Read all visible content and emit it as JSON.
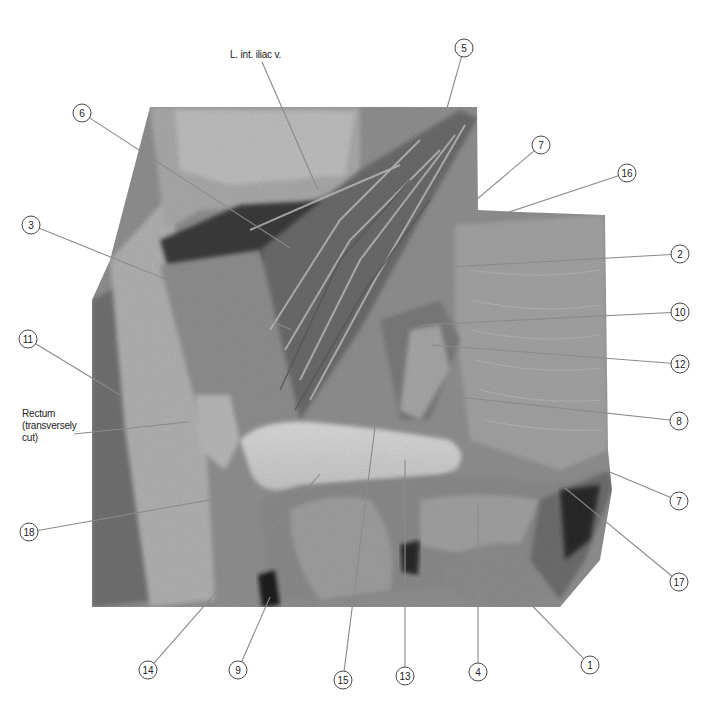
{
  "figure": {
    "type": "anatomical dissection photograph (grayscale)",
    "background": "#ffffff",
    "leader_color": "#8a8a8a"
  },
  "text_labels": [
    {
      "id": "l-int-iliac-v",
      "text": "L. int. iliac v.",
      "x": 230,
      "y": 55,
      "target": [
        318,
        190
      ]
    },
    {
      "id": "rectum",
      "lines": [
        "Rectum",
        "(transversely",
        "cut)"
      ],
      "x": 22,
      "y": 420,
      "target": [
        188,
        422
      ]
    }
  ],
  "callouts": [
    {
      "num": "5",
      "cx": 464,
      "cy": 48,
      "tx": 447,
      "ty": 108
    },
    {
      "num": "6",
      "cx": 82,
      "cy": 113,
      "tx": 290,
      "ty": 248
    },
    {
      "num": "7",
      "cx": 541,
      "cy": 145,
      "tx": 470,
      "ty": 205
    },
    {
      "num": "16",
      "cx": 627,
      "cy": 173,
      "tx": 476,
      "ty": 223
    },
    {
      "num": "3",
      "cx": 31,
      "cy": 225,
      "tx": 292,
      "ty": 330
    },
    {
      "num": "2",
      "cx": 680,
      "cy": 254,
      "tx": 432,
      "ty": 268
    },
    {
      "num": "10",
      "cx": 680,
      "cy": 312,
      "tx": 420,
      "ty": 325
    },
    {
      "num": "11",
      "cx": 28,
      "cy": 339,
      "tx": 120,
      "ty": 395
    },
    {
      "num": "12",
      "cx": 680,
      "cy": 364,
      "tx": 432,
      "ty": 345
    },
    {
      "num": "8",
      "cx": 679,
      "cy": 421,
      "tx": 440,
      "ty": 395
    },
    {
      "num": "7",
      "cx": 679,
      "cy": 501,
      "tx": 605,
      "ty": 470
    },
    {
      "num": "18",
      "cx": 29,
      "cy": 532,
      "tx": 260,
      "ty": 491
    },
    {
      "num": "17",
      "cx": 679,
      "cy": 582,
      "tx": 565,
      "ty": 488
    },
    {
      "num": "14",
      "cx": 148,
      "cy": 670,
      "tx": 320,
      "ty": 474
    },
    {
      "num": "9",
      "cx": 238,
      "cy": 670,
      "tx": 270,
      "ty": 597
    },
    {
      "num": "15",
      "cx": 343,
      "cy": 680,
      "tx": 375,
      "ty": 427
    },
    {
      "num": "13",
      "cx": 405,
      "cy": 676,
      "tx": 405,
      "ty": 460
    },
    {
      "num": "4",
      "cx": 478,
      "cy": 672,
      "tx": 478,
      "ty": 505
    },
    {
      "num": "1",
      "cx": 590,
      "cy": 665,
      "tx": 512,
      "ty": 585
    }
  ]
}
